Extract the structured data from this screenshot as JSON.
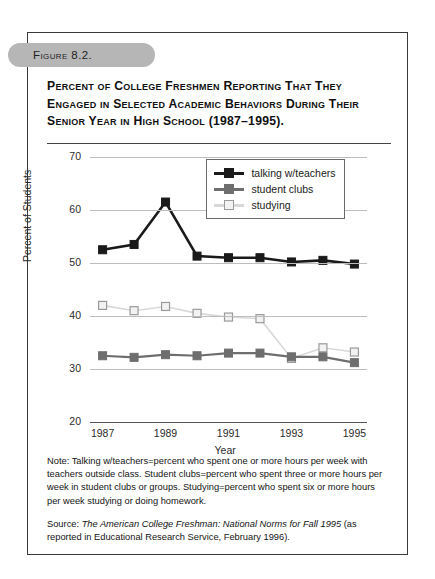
{
  "figure": {
    "tab_label": "Figure 8.2.",
    "title": "Percent of College Freshmen Reporting That They Engaged in Selected Academic Behaviors During Their Senior Year in High School (1987–1995).",
    "note": "Note: Talking w/teachers=percent who spent one or more hours per week with teachers outside class. Student clubs=percent who spent three or more hours per week in student clubs or groups. Studying=percent who spent six or more hours per week studying or doing homework.",
    "source_prefix": "Source: ",
    "source_italic": "The American College Freshman: National Norms for Fall 1995",
    "source_suffix": " (as reported in Educational Research Service, February 1996)."
  },
  "colors": {
    "talking": "#1a1a1a",
    "clubs": "#6e6e6e",
    "studying": "#d8d8d8",
    "studying_marker_border": "#9a9a9a",
    "grid": "#bdbdbd",
    "axis": "#555555",
    "tab": "#b6b6b6",
    "frame": "#3a3a3a"
  },
  "chart_data": {
    "type": "line",
    "xlabel": "Year",
    "ylabel": "Percent of Students",
    "x": [
      1987,
      1988,
      1989,
      1990,
      1991,
      1992,
      1993,
      1994,
      1995
    ],
    "xtick_labels": [
      "1987",
      "1989",
      "1991",
      "1993",
      "1995"
    ],
    "xtick_values": [
      1987,
      1989,
      1991,
      1993,
      1995
    ],
    "ytick_labels": [
      "20",
      "30",
      "40",
      "50",
      "60",
      "70"
    ],
    "ytick_values": [
      20,
      30,
      40,
      50,
      60,
      70
    ],
    "xlim": [
      1986.6,
      1995.4
    ],
    "ylim": [
      20,
      70
    ],
    "grid": true,
    "legend_position": "upper right",
    "series": [
      {
        "name": "talking w/teachers",
        "color": "#1a1a1a",
        "marker": "filled-square",
        "values": [
          52.5,
          53.5,
          61.5,
          51.3,
          51.0,
          51.0,
          50.2,
          50.5,
          49.8
        ]
      },
      {
        "name": "student clubs",
        "color": "#6e6e6e",
        "marker": "filled-square",
        "values": [
          32.5,
          32.2,
          32.7,
          32.5,
          33.0,
          33.0,
          32.3,
          32.3,
          31.2
        ]
      },
      {
        "name": "studying",
        "color": "#d8d8d8",
        "marker": "open-square",
        "values": [
          42.0,
          41.0,
          41.8,
          40.5,
          39.8,
          39.5,
          32.0,
          34.0,
          33.2
        ]
      }
    ]
  }
}
